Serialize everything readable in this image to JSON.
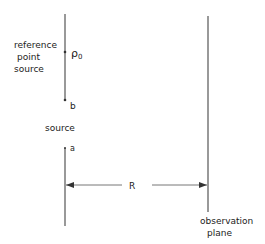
{
  "diagram": {
    "labels": {
      "reference_line1": "reference",
      "reference_line2": "point",
      "reference_line3": "source",
      "rho": "ρ",
      "rho_sub": "0",
      "b": "b",
      "source": "source",
      "a": "a",
      "R": "R",
      "observation_line1": "observation",
      "observation_line2": "plane"
    },
    "colors": {
      "line": "#555555",
      "text": "#222222"
    }
  }
}
